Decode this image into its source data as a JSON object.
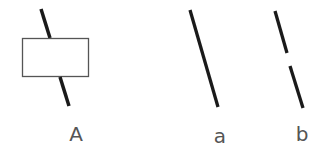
{
  "figures": [
    {
      "id": "A",
      "label": "A",
      "description": "line passing behind a rectangle"
    },
    {
      "id": "a",
      "label": "a",
      "description": "continuous slanted line"
    },
    {
      "id": "b",
      "label": "b",
      "description": "slanted line with a gap"
    }
  ],
  "colors": {
    "line": "#1a1a1a",
    "box_stroke": "#555555",
    "label": "#555555"
  }
}
